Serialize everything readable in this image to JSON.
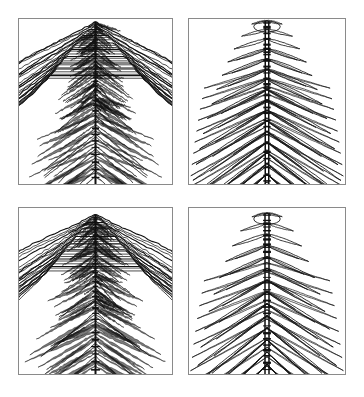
{
  "figure": {
    "background_color": "#ffffff",
    "line_color": "#111111",
    "border_color": "#8a8a8a",
    "rows": 2,
    "columns": 2
  },
  "panels": [
    {
      "id": "panel-top-left",
      "name": "top-left-panel",
      "caption": "(a)",
      "row": 0,
      "column": 0,
      "x": 18,
      "y": 18,
      "width": 155,
      "height": 167,
      "density": "dense",
      "contour_count": 26,
      "spine_style": "beaded",
      "spine_width": 2.0,
      "apex_x_fraction": 0.5,
      "apex_y_fraction": 0.02,
      "branch_count": 19,
      "branch_spread_deg": 34,
      "noise_amplitude": 1.35,
      "line_width": 0.75,
      "fill_shading": true
    },
    {
      "id": "panel-top-right",
      "name": "top-right-panel",
      "caption": "(b)",
      "row": 0,
      "column": 1,
      "x": 188,
      "y": 18,
      "width": 158,
      "height": 167,
      "density": "sparse",
      "contour_count": 15,
      "spine_style": "ladder",
      "spine_width": 5.0,
      "apex_x_fraction": 0.5,
      "apex_y_fraction": 0.01,
      "branch_count": 16,
      "branch_spread_deg": 30,
      "noise_amplitude": 0.35,
      "line_width": 0.85,
      "fill_shading": false
    },
    {
      "id": "panel-bottom-left",
      "name": "bottom-left-panel",
      "caption": "(c)",
      "row": 1,
      "column": 0,
      "x": 18,
      "y": 207,
      "width": 155,
      "height": 168,
      "density": "dense",
      "contour_count": 24,
      "spine_style": "beaded",
      "spine_width": 2.0,
      "apex_x_fraction": 0.5,
      "apex_y_fraction": 0.04,
      "branch_count": 18,
      "branch_spread_deg": 37,
      "noise_amplitude": 1.25,
      "line_width": 0.75,
      "fill_shading": true
    },
    {
      "id": "panel-bottom-right",
      "name": "bottom-right-panel",
      "caption": "(d)",
      "row": 1,
      "column": 1,
      "x": 188,
      "y": 207,
      "width": 158,
      "height": 168,
      "density": "sparse",
      "contour_count": 13,
      "spine_style": "ladder",
      "spine_width": 5.5,
      "apex_x_fraction": 0.5,
      "apex_y_fraction": 0.03,
      "branch_count": 14,
      "branch_spread_deg": 33,
      "noise_amplitude": 0.3,
      "line_width": 0.85,
      "fill_shading": false
    }
  ],
  "chart_data": {
    "type": "contour",
    "subtitle": "",
    "xlabel": "",
    "ylabel": "",
    "grid": false,
    "legend": "none",
    "axis_ticks": false,
    "panel_labels": [
      "(a)",
      "(b)",
      "(c)",
      "(d)"
    ],
    "series": [
      {
        "name": "(a) dense contour field",
        "panel": "panel-top-left",
        "levels": 26,
        "symmetry": "mirror about vertical central axis",
        "structure": "chevron lobes descending from apex, increasing width toward base"
      },
      {
        "name": "(b) sparse contour field",
        "panel": "panel-top-right",
        "levels": 15,
        "symmetry": "mirror about vertical central axis",
        "structure": "elongated teardrop lobes radiating from central ladder spine"
      },
      {
        "name": "(c) dense contour field",
        "panel": "panel-bottom-left",
        "levels": 24,
        "symmetry": "mirror about vertical central axis",
        "structure": "chevron lobes descending from apex with nested inner arcs"
      },
      {
        "name": "(d) sparse contour field",
        "panel": "panel-bottom-right",
        "levels": 13,
        "symmetry": "mirror about vertical central axis",
        "structure": "long sweeping lobes from central ladder spine, widest at base"
      }
    ],
    "xlim": [
      -1,
      1
    ],
    "ylim": [
      0,
      1
    ]
  }
}
